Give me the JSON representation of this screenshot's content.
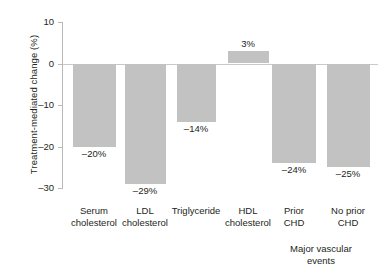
{
  "chart_data": {
    "type": "bar",
    "title": "",
    "xlabel": "",
    "ylabel": "Treatment-mediated change (%)",
    "ylim": [
      -30,
      10
    ],
    "yticks": [
      10,
      0,
      -10,
      -20,
      -30
    ],
    "ytick_labels": [
      "10",
      "0",
      "–10",
      "–20",
      "–30"
    ],
    "grid": false,
    "legend": "none",
    "bar_color": "#c2c2c2",
    "zero_line": 0,
    "categories": [
      "Serum\ncholesterol",
      "LDL\ncholesterol",
      "Triglyceride",
      "HDL\ncholesterol",
      "Prior\nCHD",
      "No prior\nCHD"
    ],
    "values": [
      -20,
      -29,
      -14,
      3,
      -24,
      -25
    ],
    "value_labels": [
      "–20%",
      "–29%",
      "–14%",
      "3%",
      "–24%",
      "–25%"
    ],
    "group_annotation": {
      "label": "Major vascular\nevents",
      "covers": [
        "Prior\nCHD",
        "No prior\nCHD"
      ]
    }
  }
}
